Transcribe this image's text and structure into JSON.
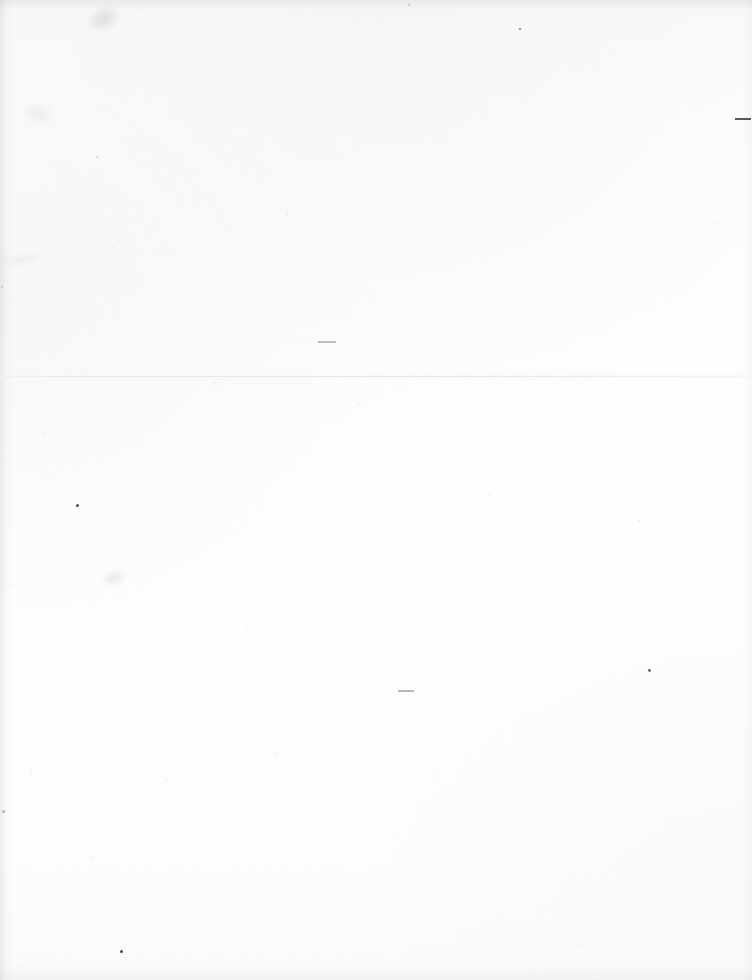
{
  "document": {
    "kind": "scanned-page",
    "page_content": "",
    "page_text": "",
    "visible_text": "",
    "description": "Blank scanned paper page with scanner noise",
    "width_px": 752,
    "height_px": 980
  },
  "colors": {
    "paper": "#fdfdfd",
    "paper_white": "#ffffff",
    "paper_shade": "#fafafa",
    "fold_line": "#c4c4ca",
    "speck_dark": "#2e2e30",
    "speck_mid": "#8a8a90",
    "speck_light": "#c9c9cf",
    "smudge_grey": "#9a9aa0",
    "edge_shadow": "#96969b"
  },
  "artifacts": {
    "fold_line": {
      "label": "faint horizontal scan line",
      "y": 376
    },
    "ghost_rows": [
      {
        "label": "bleed-through text row upper",
        "x": 196,
        "y": 334,
        "size": 9,
        "text": "·  ·   ·   ·  ·· ·   ···  ·    ··   ··   ·· ·   ··      ·  ·      ··· "
      },
      {
        "label": "bleed-through text row lower",
        "x": 96,
        "y": 684,
        "size": 9,
        "text": "·   ·· ·    ·· · · ·· ·        ··    ··    ·· ·· ···   ··    ··   ·"
      }
    ],
    "smudges": [
      {
        "label": "pencil-smudge-top-left",
        "x": 88,
        "y": 6,
        "w": 34,
        "h": 24,
        "opacity": 0.3,
        "blur": 2.4,
        "rotate": -24
      },
      {
        "label": "pencil-smudge-upper-left",
        "x": 24,
        "y": 104,
        "w": 30,
        "h": 20,
        "opacity": 0.16,
        "blur": 3.0,
        "rotate": 12
      },
      {
        "label": "pencil-smudge-mid-left",
        "x": 102,
        "y": 570,
        "w": 26,
        "h": 15,
        "opacity": 0.22,
        "blur": 2.2,
        "rotate": -18
      },
      {
        "label": "streak-smudge-left-edge",
        "x": 0,
        "y": 255,
        "w": 46,
        "h": 9,
        "opacity": 0.14,
        "blur": 2.6,
        "rotate": -6
      }
    ],
    "specks": [
      {
        "label": "speck-dark-mid-left",
        "x": 76,
        "y": 504,
        "d": 3.2,
        "opacity": 0.85,
        "tone": "dark"
      },
      {
        "label": "speck-dark-bottom",
        "x": 120,
        "y": 950,
        "d": 3.4,
        "opacity": 0.88,
        "tone": "dark"
      },
      {
        "label": "speck-dark-right",
        "x": 648,
        "y": 669,
        "d": 2.8,
        "opacity": 0.7,
        "tone": "dark"
      },
      {
        "label": "speck-dark-top",
        "x": 519,
        "y": 28,
        "d": 2.2,
        "opacity": 0.62,
        "tone": "dark"
      },
      {
        "label": "speck-mid-top-mid",
        "x": 408,
        "y": 4,
        "d": 2.0,
        "opacity": 0.45,
        "tone": "mid"
      },
      {
        "label": "speck-mid-left-edge",
        "x": 2,
        "y": 810,
        "d": 2.6,
        "opacity": 0.55,
        "tone": "mid"
      },
      {
        "label": "speck-mid-left-edge-2",
        "x": 1,
        "y": 286,
        "d": 2.2,
        "opacity": 0.4,
        "tone": "mid"
      },
      {
        "label": "speck-mid-upper-left",
        "x": 96,
        "y": 156,
        "d": 1.8,
        "opacity": 0.35,
        "tone": "mid"
      },
      {
        "label": "speck-light-1",
        "x": 286,
        "y": 214,
        "d": 1.6,
        "opacity": 0.28,
        "tone": "light"
      },
      {
        "label": "speck-light-2",
        "x": 118,
        "y": 240,
        "d": 1.5,
        "opacity": 0.25,
        "tone": "light"
      },
      {
        "label": "speck-light-3",
        "x": 455,
        "y": 205,
        "d": 1.5,
        "opacity": 0.24,
        "tone": "light"
      },
      {
        "label": "speck-light-4",
        "x": 530,
        "y": 170,
        "d": 1.4,
        "opacity": 0.22,
        "tone": "light"
      },
      {
        "label": "speck-light-5",
        "x": 44,
        "y": 432,
        "d": 1.8,
        "opacity": 0.3,
        "tone": "light"
      },
      {
        "label": "speck-light-6",
        "x": 66,
        "y": 458,
        "d": 1.5,
        "opacity": 0.24,
        "tone": "light"
      },
      {
        "label": "speck-light-7",
        "x": 246,
        "y": 628,
        "d": 1.6,
        "opacity": 0.26,
        "tone": "light"
      },
      {
        "label": "speck-light-8",
        "x": 276,
        "y": 752,
        "d": 1.7,
        "opacity": 0.28,
        "tone": "light"
      },
      {
        "label": "speck-light-9",
        "x": 30,
        "y": 772,
        "d": 1.5,
        "opacity": 0.24,
        "tone": "light"
      },
      {
        "label": "speck-light-10",
        "x": 166,
        "y": 780,
        "d": 1.5,
        "opacity": 0.24,
        "tone": "light"
      },
      {
        "label": "speck-light-11",
        "x": 322,
        "y": 884,
        "d": 1.6,
        "opacity": 0.26,
        "tone": "light"
      },
      {
        "label": "speck-light-12",
        "x": 580,
        "y": 944,
        "d": 1.5,
        "opacity": 0.24,
        "tone": "light"
      },
      {
        "label": "speck-light-13",
        "x": 638,
        "y": 520,
        "d": 1.6,
        "opacity": 0.26,
        "tone": "light"
      },
      {
        "label": "speck-light-14",
        "x": 700,
        "y": 470,
        "d": 1.4,
        "opacity": 0.22,
        "tone": "light"
      },
      {
        "label": "speck-light-15",
        "x": 488,
        "y": 494,
        "d": 1.5,
        "opacity": 0.23,
        "tone": "light"
      },
      {
        "label": "speck-light-16",
        "x": 358,
        "y": 404,
        "d": 1.6,
        "opacity": 0.26,
        "tone": "light"
      },
      {
        "label": "speck-light-17",
        "x": 214,
        "y": 382,
        "d": 1.5,
        "opacity": 0.24,
        "tone": "light"
      },
      {
        "label": "speck-light-18",
        "x": 140,
        "y": 8,
        "d": 1.5,
        "opacity": 0.24,
        "tone": "light"
      },
      {
        "label": "speck-light-19",
        "x": 380,
        "y": 40,
        "d": 1.4,
        "opacity": 0.22,
        "tone": "light"
      },
      {
        "label": "speck-light-20",
        "x": 600,
        "y": 86,
        "d": 1.4,
        "opacity": 0.22,
        "tone": "light"
      },
      {
        "label": "speck-light-21",
        "x": 716,
        "y": 222,
        "d": 1.5,
        "opacity": 0.23,
        "tone": "light"
      },
      {
        "label": "speck-light-22",
        "x": 744,
        "y": 364,
        "d": 1.4,
        "opacity": 0.22,
        "tone": "light"
      },
      {
        "label": "speck-light-23",
        "x": 10,
        "y": 584,
        "d": 1.5,
        "opacity": 0.24,
        "tone": "light"
      },
      {
        "label": "speck-light-24",
        "x": 92,
        "y": 856,
        "d": 1.5,
        "opacity": 0.24,
        "tone": "light"
      },
      {
        "label": "speck-light-25",
        "x": 432,
        "y": 828,
        "d": 1.4,
        "opacity": 0.22,
        "tone": "light"
      }
    ],
    "dashes": [
      {
        "label": "dark-dash-right-edge",
        "x": 735,
        "y": 118,
        "w": 16,
        "h": 2.4,
        "opacity": 0.8,
        "rotate": 0
      },
      {
        "label": "faint-dash-mid",
        "x": 318,
        "y": 341,
        "w": 18,
        "h": 1.6,
        "opacity": 0.3,
        "rotate": 0
      },
      {
        "label": "faint-dash-lower",
        "x": 398,
        "y": 690,
        "w": 16,
        "h": 1.6,
        "opacity": 0.32,
        "rotate": 0
      }
    ]
  }
}
